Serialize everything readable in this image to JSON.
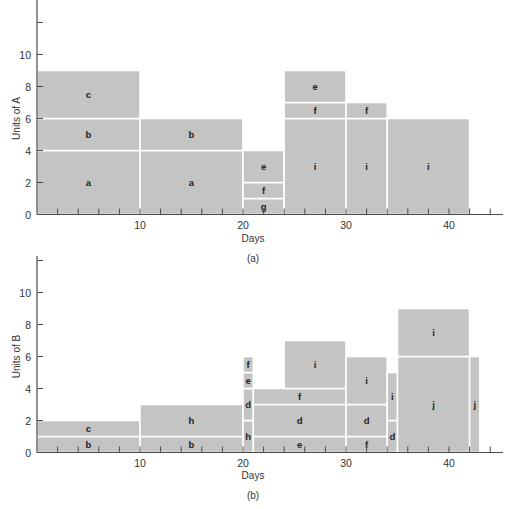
{
  "chart_data": [
    {
      "id": "a",
      "type": "bar",
      "subtype": "resource-loading-stacked",
      "caption": "(a)",
      "xlabel": "Days",
      "ylabel": "Units of A",
      "xticks": [
        "10",
        "20",
        "30",
        "40"
      ],
      "yticks": [
        "0",
        "2",
        "4",
        "6",
        "8",
        "10"
      ],
      "xlim": [
        0,
        45
      ],
      "ylim": [
        0,
        12
      ],
      "grid": false,
      "blocks": [
        {
          "label": "a",
          "x0": 0,
          "x1": 10,
          "y0": 0,
          "y1": 4
        },
        {
          "label": "b",
          "x0": 0,
          "x1": 10,
          "y0": 4,
          "y1": 6
        },
        {
          "label": "c",
          "x0": 0,
          "x1": 10,
          "y0": 6,
          "y1": 9
        },
        {
          "label": "a",
          "x0": 10,
          "x1": 20,
          "y0": 0,
          "y1": 4
        },
        {
          "label": "b",
          "x0": 10,
          "x1": 20,
          "y0": 4,
          "y1": 6
        },
        {
          "label": "g",
          "x0": 20,
          "x1": 24,
          "y0": 0,
          "y1": 1
        },
        {
          "label": "f",
          "x0": 20,
          "x1": 24,
          "y0": 1,
          "y1": 2
        },
        {
          "label": "e",
          "x0": 20,
          "x1": 24,
          "y0": 2,
          "y1": 4
        },
        {
          "label": "i",
          "x0": 24,
          "x1": 30,
          "y0": 0,
          "y1": 6
        },
        {
          "label": "f",
          "x0": 24,
          "x1": 30,
          "y0": 6,
          "y1": 7
        },
        {
          "label": "e",
          "x0": 24,
          "x1": 30,
          "y0": 7,
          "y1": 9
        },
        {
          "label": "i",
          "x0": 30,
          "x1": 34,
          "y0": 0,
          "y1": 6
        },
        {
          "label": "f",
          "x0": 30,
          "x1": 34,
          "y0": 6,
          "y1": 7
        },
        {
          "label": "i",
          "x0": 34,
          "x1": 42,
          "y0": 0,
          "y1": 6
        }
      ]
    },
    {
      "id": "b",
      "type": "bar",
      "subtype": "resource-loading-stacked",
      "caption": "(b)",
      "xlabel": "Days",
      "ylabel": "Units of B",
      "xticks": [
        "10",
        "20",
        "30",
        "40"
      ],
      "yticks": [
        "0",
        "2",
        "4",
        "6",
        "8",
        "10"
      ],
      "xlim": [
        0,
        45
      ],
      "ylim": [
        0,
        12
      ],
      "grid": false,
      "blocks": [
        {
          "label": "b",
          "x0": 0,
          "x1": 10,
          "y0": 0,
          "y1": 1
        },
        {
          "label": "c",
          "x0": 0,
          "x1": 10,
          "y0": 1,
          "y1": 2
        },
        {
          "label": "b",
          "x0": 10,
          "x1": 20,
          "y0": 0,
          "y1": 1
        },
        {
          "label": "h",
          "x0": 10,
          "x1": 20,
          "y0": 1,
          "y1": 3
        },
        {
          "label": "h",
          "x0": 20,
          "x1": 21,
          "y0": 0,
          "y1": 2
        },
        {
          "label": "d",
          "x0": 20,
          "x1": 21,
          "y0": 2,
          "y1": 4
        },
        {
          "label": "e",
          "x0": 20,
          "x1": 21,
          "y0": 4,
          "y1": 5
        },
        {
          "label": "f",
          "x0": 20,
          "x1": 21,
          "y0": 5,
          "y1": 6
        },
        {
          "label": "e",
          "x0": 21,
          "x1": 30,
          "y0": 0,
          "y1": 1
        },
        {
          "label": "d",
          "x0": 21,
          "x1": 30,
          "y0": 1,
          "y1": 3
        },
        {
          "label": "f",
          "x0": 21,
          "x1": 30,
          "y0": 3,
          "y1": 4
        },
        {
          "label": "i",
          "x0": 24,
          "x1": 30,
          "y0": 4,
          "y1": 7
        },
        {
          "label": "f",
          "x0": 30,
          "x1": 34,
          "y0": 0,
          "y1": 1
        },
        {
          "label": "d",
          "x0": 30,
          "x1": 34,
          "y0": 1,
          "y1": 3
        },
        {
          "label": "i",
          "x0": 30,
          "x1": 34,
          "y0": 3,
          "y1": 6
        },
        {
          "label": "d",
          "x0": 34,
          "x1": 35,
          "y0": 0,
          "y1": 2
        },
        {
          "label": "i",
          "x0": 34,
          "x1": 35,
          "y0": 2,
          "y1": 5
        },
        {
          "label": "j",
          "x0": 35,
          "x1": 42,
          "y0": 0,
          "y1": 6
        },
        {
          "label": "i",
          "x0": 35,
          "x1": 42,
          "y0": 6,
          "y1": 9
        },
        {
          "label": "j",
          "x0": 42,
          "x1": 43,
          "y0": 0,
          "y1": 6
        }
      ]
    }
  ]
}
